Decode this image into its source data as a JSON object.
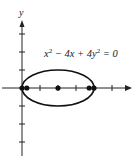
{
  "chart_data": {
    "type": "line",
    "title": "",
    "xlabel": "",
    "ylabel": "y",
    "annotation": "x² − 4x + 4y² = 0",
    "equation": "x^2 - 4x + 4y^2 = 0",
    "curve": {
      "kind": "ellipse",
      "center": [
        2,
        0
      ],
      "semi_major_x": 2,
      "semi_minor_y": 1
    },
    "points": [
      {
        "label": "left vertex",
        "x": 0,
        "y": 0
      },
      {
        "label": "focus 1",
        "x": 0.268,
        "y": 0
      },
      {
        "label": "center",
        "x": 2,
        "y": 0
      },
      {
        "label": "focus 2",
        "x": 3.732,
        "y": 0
      },
      {
        "label": "right vertex",
        "x": 4,
        "y": 0
      }
    ],
    "xlim": [
      -1,
      6
    ],
    "ylim": [
      -4,
      4
    ],
    "x_ticks": [
      1,
      2,
      3,
      4,
      5
    ],
    "y_ticks": [
      -3,
      -2,
      -1,
      1,
      2,
      3
    ],
    "grid": false,
    "color": "#111111"
  }
}
